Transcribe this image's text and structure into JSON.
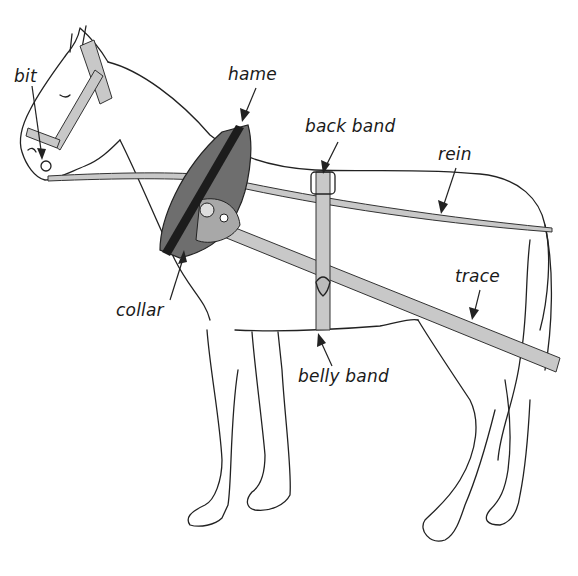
{
  "diagram": {
    "colors": {
      "outline": "#222222",
      "strap_fill": "#c8c8c8",
      "collar_fill": "#6e6e6e",
      "hame_fill": "#1c1c1c",
      "background": "#ffffff"
    },
    "labels": [
      {
        "id": "bit",
        "text": "bit",
        "x": 14,
        "y": 72,
        "points_to": [
          42,
          158
        ]
      },
      {
        "id": "hame",
        "text": "hame",
        "x": 228,
        "y": 66,
        "points_to": [
          242,
          120
        ]
      },
      {
        "id": "back-band",
        "text": "back band",
        "x": 305,
        "y": 118,
        "points_to": [
          324,
          172
        ]
      },
      {
        "id": "rein",
        "text": "rein",
        "x": 438,
        "y": 146,
        "points_to": [
          441,
          212
        ]
      },
      {
        "id": "trace",
        "text": "trace",
        "x": 455,
        "y": 268,
        "points_to": [
          472,
          318
        ]
      },
      {
        "id": "collar",
        "text": "collar",
        "x": 116,
        "y": 302,
        "points_to": [
          183,
          250
        ]
      },
      {
        "id": "belly-band",
        "text": "belly band",
        "x": 298,
        "y": 368,
        "points_to": [
          318,
          333
        ]
      }
    ]
  }
}
